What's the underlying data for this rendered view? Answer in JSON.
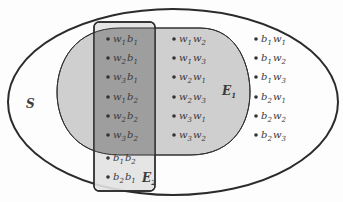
{
  "diagram": {
    "type": "venn-sample-space",
    "colors": {
      "background": "#fdfdfd",
      "outline": "#2b2b2b",
      "e1_fill": "#cfcfcf",
      "e2_fill": "#e2e2e2",
      "overlap_fill": "#9e9e9e",
      "point": "#333333",
      "text": "#3a3a3a"
    },
    "sets": {
      "S": {
        "label": "S"
      },
      "E1": {
        "label": "E",
        "sub": "1"
      },
      "E2": {
        "label": "E",
        "sub": "2"
      }
    },
    "intersection_points": [
      {
        "a": "w",
        "a_sub": "1",
        "b": "b",
        "b_sub": "1"
      },
      {
        "a": "w",
        "a_sub": "2",
        "b": "b",
        "b_sub": "1"
      },
      {
        "a": "w",
        "a_sub": "3",
        "b": "b",
        "b_sub": "1"
      },
      {
        "a": "w",
        "a_sub": "1",
        "b": "b",
        "b_sub": "2"
      },
      {
        "a": "w",
        "a_sub": "2",
        "b": "b",
        "b_sub": "2"
      },
      {
        "a": "w",
        "a_sub": "3",
        "b": "b",
        "b_sub": "2"
      }
    ],
    "e2_only_points": [
      {
        "a": "b",
        "a_sub": "1",
        "b": "b",
        "b_sub": "2"
      },
      {
        "a": "b",
        "a_sub": "2",
        "b": "b",
        "b_sub": "1"
      }
    ],
    "e1_only_points": [
      {
        "a": "w",
        "a_sub": "1",
        "b": "w",
        "b_sub": "2"
      },
      {
        "a": "w",
        "a_sub": "1",
        "b": "w",
        "b_sub": "3"
      },
      {
        "a": "w",
        "a_sub": "2",
        "b": "w",
        "b_sub": "1"
      },
      {
        "a": "w",
        "a_sub": "2",
        "b": "w",
        "b_sub": "3"
      },
      {
        "a": "w",
        "a_sub": "3",
        "b": "w",
        "b_sub": "1"
      },
      {
        "a": "w",
        "a_sub": "3",
        "b": "w",
        "b_sub": "2"
      }
    ],
    "outside_points": [
      {
        "a": "b",
        "a_sub": "1",
        "b": "w",
        "b_sub": "1"
      },
      {
        "a": "b",
        "a_sub": "1",
        "b": "w",
        "b_sub": "2"
      },
      {
        "a": "b",
        "a_sub": "1",
        "b": "w",
        "b_sub": "3"
      },
      {
        "a": "b",
        "a_sub": "2",
        "b": "w",
        "b_sub": "1"
      },
      {
        "a": "b",
        "a_sub": "2",
        "b": "w",
        "b_sub": "2"
      },
      {
        "a": "b",
        "a_sub": "2",
        "b": "w",
        "b_sub": "3"
      }
    ]
  }
}
